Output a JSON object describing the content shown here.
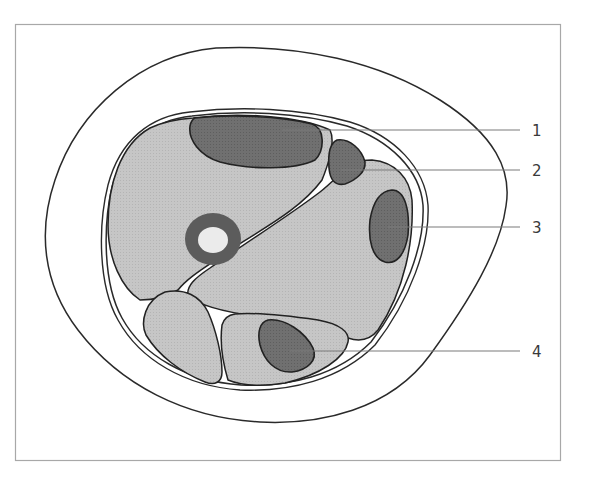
{
  "diagram": {
    "kind": "cross-section illustration",
    "colors": {
      "background": "#ffffff",
      "frame": "#a8a8a8",
      "outline": "#2a2a2a",
      "light_muscle": "#c4c4c4",
      "dark_structure": "#6e6e6e",
      "bone_ring": "#5c5c5c",
      "bone_marrow": "#ebebeb",
      "leader_line": "#7a7a7a",
      "label_text": "#3a3a3a"
    },
    "labels": [
      {
        "id": "1",
        "text": "1",
        "target": "upper dark oval structure"
      },
      {
        "id": "2",
        "text": "2",
        "target": "small dark triangular structure"
      },
      {
        "id": "3",
        "text": "3",
        "target": "right dark oval structure"
      },
      {
        "id": "4",
        "text": "4",
        "target": "lower dark oval structure"
      }
    ]
  }
}
